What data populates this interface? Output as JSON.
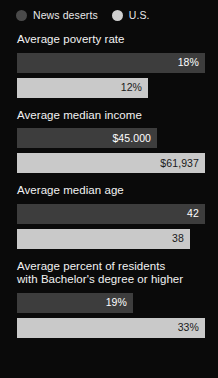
{
  "legend": {
    "items": [
      {
        "label": "News deserts",
        "color": "#4a4a4a",
        "icon": "circle-icon"
      },
      {
        "label": "U.S.",
        "color": "#cfcfcf",
        "icon": "circle-icon"
      }
    ]
  },
  "colors": {
    "background": "#0a0a0a",
    "bar_dark": "#3d3d3d",
    "bar_light": "#c9c9c9",
    "text_light": "#f2f2f2",
    "text_dark": "#1a1a1a"
  },
  "sections": [
    {
      "title": "Average poverty rate",
      "bars": [
        {
          "series": "News deserts",
          "label": "18%",
          "width_pct": 100
        },
        {
          "series": "U.S.",
          "label": "12%",
          "width_pct": 69.7
        }
      ]
    },
    {
      "title": "Average median income",
      "bars": [
        {
          "series": "News deserts",
          "label": "$45.000",
          "width_pct": 74.5
        },
        {
          "series": "U.S.",
          "label": "$61,937",
          "width_pct": 100
        }
      ]
    },
    {
      "title": "Average median age",
      "bars": [
        {
          "series": "News deserts",
          "label": "42",
          "width_pct": 100
        },
        {
          "series": "U.S.",
          "label": "38",
          "width_pct": 92
        }
      ]
    },
    {
      "title": "Average percent of residents\nwith Bachelor's degree or higher",
      "bars": [
        {
          "series": "News deserts",
          "label": "19%",
          "width_pct": 61.7
        },
        {
          "series": "U.S.",
          "label": "33%",
          "width_pct": 100
        }
      ]
    }
  ],
  "chart_data": {
    "type": "bar",
    "orientation": "horizontal",
    "title": "",
    "legend_position": "top-left",
    "grid": false,
    "series": [
      {
        "name": "News deserts",
        "color": "#3d3d3d",
        "values": [
          18,
          45000,
          42,
          19
        ],
        "labels": [
          "18%",
          "$45.000",
          "42",
          "19%"
        ]
      },
      {
        "name": "U.S.",
        "color": "#c9c9c9",
        "values": [
          12,
          61937,
          38,
          33
        ],
        "labels": [
          "12%",
          "$61,937",
          "38",
          "33%"
        ]
      }
    ],
    "categories": [
      "Average poverty rate",
      "Average median income",
      "Average median age",
      "Average percent of residents with Bachelor's degree or higher"
    ],
    "xlabel": "",
    "ylabel": ""
  }
}
